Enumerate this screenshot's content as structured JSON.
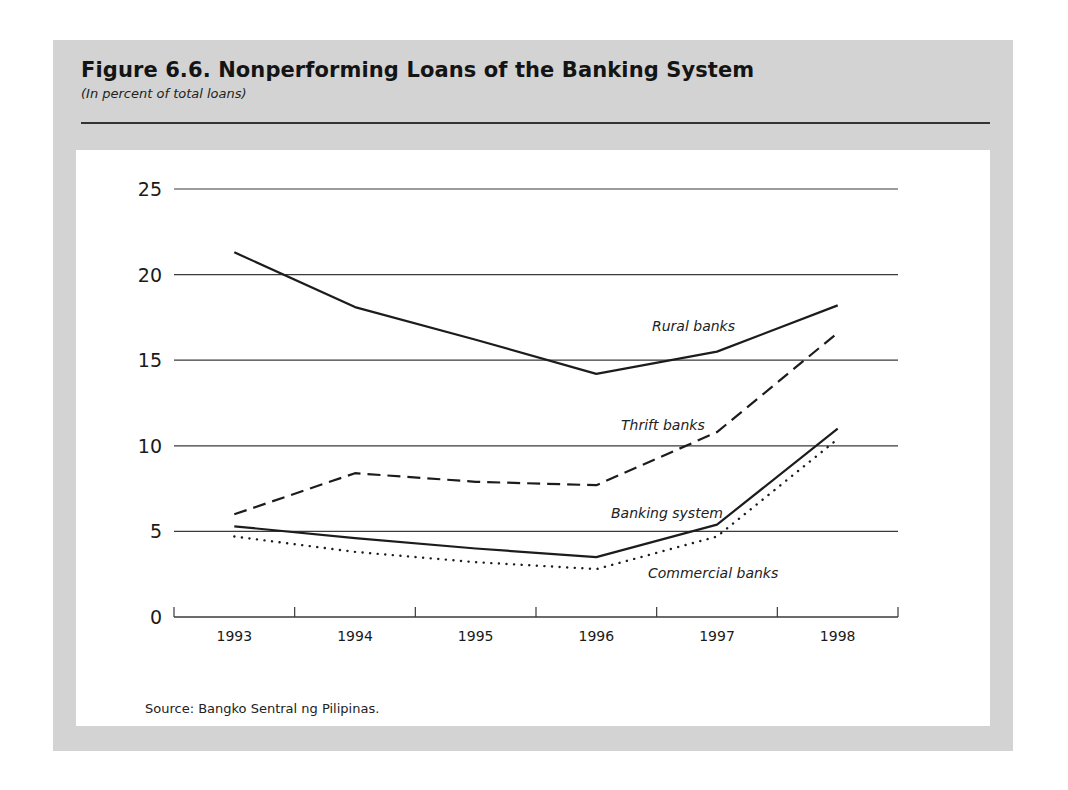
{
  "figure": {
    "title": "Figure 6.6.  Nonperforming Loans of the Banking System",
    "subtitle": "(In percent of total loans)",
    "source": "Source:  Bangko Sentral ng Pilipinas."
  },
  "chart_data": {
    "type": "line",
    "title": "Nonperforming Loans of the Banking System",
    "subtitle": "In percent of total loans",
    "xlabel": "",
    "ylabel": "",
    "categories": [
      "1993",
      "1994",
      "1995",
      "1996",
      "1997",
      "1998"
    ],
    "ylim": [
      0,
      25
    ],
    "yticks": [
      "0",
      "5",
      "10",
      "15",
      "20",
      "25"
    ],
    "grid": true,
    "legend": "inline labels",
    "series": [
      {
        "name": "Rural banks",
        "style": "solid",
        "values": [
          21.3,
          18.1,
          16.2,
          14.2,
          15.5,
          18.2
        ]
      },
      {
        "name": "Thrift banks",
        "style": "dashed",
        "values": [
          6.0,
          8.4,
          7.9,
          7.7,
          10.8,
          16.6
        ]
      },
      {
        "name": "Banking system",
        "style": "solid",
        "values": [
          5.3,
          4.6,
          4.0,
          3.5,
          5.4,
          11.0
        ]
      },
      {
        "name": "Commercial banks",
        "style": "dotted",
        "values": [
          4.7,
          3.8,
          3.2,
          2.8,
          4.7,
          10.4
        ]
      }
    ],
    "annotations": [
      {
        "text": "Rural banks",
        "series": "Rural banks"
      },
      {
        "text": "Thrift banks",
        "series": "Thrift banks"
      },
      {
        "text": "Banking system",
        "series": "Banking system"
      },
      {
        "text": "Commercial banks",
        "series": "Commercial banks"
      }
    ],
    "source": "Bangko Sentral ng Pilipinas"
  }
}
